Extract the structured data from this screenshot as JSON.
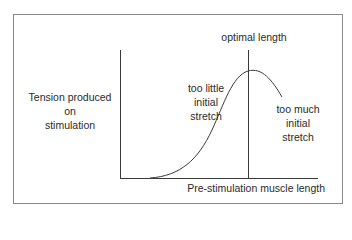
{
  "diagram": {
    "y_axis_label": "Tension produced on stimulation",
    "y_axis_label_lines": [
      "Tension produced",
      "on",
      "stimulation"
    ],
    "x_axis_label": "Pre-stimulation muscle length",
    "optimal_marker_label": "optimal length",
    "left_region_label_lines": [
      "too little",
      "initial",
      "stretch"
    ],
    "right_region_label_lines": [
      "too much",
      "initial",
      "stretch"
    ],
    "colors": {
      "line": "#3a3a3a",
      "frame": "#8a8a8a",
      "text": "#2a2a2a"
    }
  }
}
